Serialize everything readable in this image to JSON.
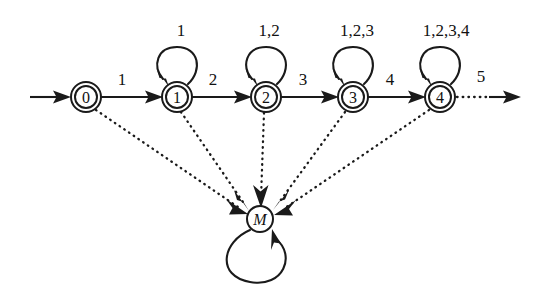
{
  "diagram": {
    "type": "state-transition-diagram",
    "background_color": "#ffffff",
    "stroke_color": "#1a1a1a",
    "states": [
      {
        "id": "s0",
        "label": "0",
        "shape": "double-circle",
        "cx": 86,
        "cy": 97,
        "r_outer": 15,
        "r_inner": 11
      },
      {
        "id": "s1",
        "label": "1",
        "shape": "double-circle",
        "cx": 177,
        "cy": 97,
        "r_outer": 15,
        "r_inner": 11
      },
      {
        "id": "s2",
        "label": "2",
        "shape": "double-circle",
        "cx": 266,
        "cy": 97,
        "r_outer": 15,
        "r_inner": 11
      },
      {
        "id": "s3",
        "label": "3",
        "shape": "double-circle",
        "cx": 353,
        "cy": 97,
        "r_outer": 15,
        "r_inner": 11
      },
      {
        "id": "s4",
        "label": "4",
        "shape": "double-circle",
        "cx": 440,
        "cy": 97,
        "r_outer": 15,
        "r_inner": 11
      },
      {
        "id": "sM",
        "label": "M",
        "shape": "single-circle",
        "cx": 260,
        "cy": 219,
        "r_outer": 13,
        "r_inner": 0
      }
    ],
    "start_arrow": {
      "from_x": 30,
      "to_x": 68,
      "y": 97
    },
    "transitions": [
      {
        "id": "t0_1",
        "from": "s0",
        "to": "s1",
        "label": "1",
        "style": "solid",
        "label_x": 122,
        "label_y": 85
      },
      {
        "id": "t1_2",
        "from": "s1",
        "to": "s2",
        "label": "2",
        "style": "solid",
        "label_x": 213,
        "label_y": 85
      },
      {
        "id": "t2_3",
        "from": "s2",
        "to": "s3",
        "label": "3",
        "style": "solid",
        "label_x": 303,
        "label_y": 85
      },
      {
        "id": "t3_4",
        "from": "s3",
        "to": "s4",
        "label": "4",
        "style": "solid",
        "label_x": 390,
        "label_y": 85
      },
      {
        "id": "t4_out",
        "from": "s4",
        "to": "exit",
        "label": "5",
        "style": "dotted-to-solid",
        "label_x": 481,
        "label_y": 82
      }
    ],
    "self_loops": [
      {
        "id": "loop1",
        "state": "s1",
        "label": "1",
        "label_x": 181,
        "label_y": 36
      },
      {
        "id": "loop2",
        "state": "s2",
        "label": "1,2",
        "label_x": 269,
        "label_y": 36
      },
      {
        "id": "loop3",
        "state": "s3",
        "label": "1,2,3",
        "label_x": 357,
        "label_y": 36
      },
      {
        "id": "loop4",
        "state": "s4",
        "label": "1,2,3,4",
        "label_x": 446,
        "label_y": 36
      },
      {
        "id": "loopM",
        "state": "sM",
        "label": "",
        "label_x": 260,
        "label_y": 289
      }
    ],
    "monitor_edges": [
      {
        "id": "m0",
        "from": "s0",
        "to": "sM",
        "style": "dotted"
      },
      {
        "id": "m1",
        "from": "s1",
        "to": "sM",
        "style": "dotted"
      },
      {
        "id": "m2",
        "from": "s2",
        "to": "sM",
        "style": "dotted"
      },
      {
        "id": "m3",
        "from": "s3",
        "to": "sM",
        "style": "dotted"
      },
      {
        "id": "m4",
        "from": "s4",
        "to": "sM",
        "style": "dotted"
      }
    ]
  }
}
